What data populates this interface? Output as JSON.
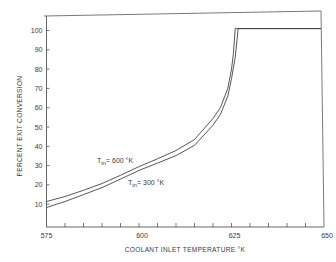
{
  "chart_data": {
    "type": "line",
    "title": "",
    "xlabel": "COOLANT INLET TEMPERATURE °K",
    "ylabel": "PERCENT EXIT CONVERSION",
    "xlim": [
      575,
      650
    ],
    "ylim": [
      0,
      105
    ],
    "grid": false,
    "legend": "none (inline annotations)",
    "x_ticks": [
      575,
      600,
      625,
      650
    ],
    "x_minor_step": 5,
    "y_ticks": [
      10,
      20,
      30,
      40,
      50,
      60,
      70,
      80,
      90,
      100
    ],
    "series": [
      {
        "name": "T_in = 600 °K",
        "x": [
          575,
          580,
          585,
          590,
          595,
          600,
          605,
          610,
          615,
          620,
          622,
          624,
          625,
          625.5,
          626,
          650
        ],
        "y": [
          11.4,
          14,
          17.2,
          20.7,
          25,
          29.5,
          33.5,
          37.8,
          43.5,
          54.4,
          60,
          70,
          80,
          88,
          101,
          101
        ]
      },
      {
        "name": "T_in = 300 °K",
        "x": [
          575,
          580,
          585,
          590,
          595,
          600,
          605,
          610,
          615,
          620,
          622,
          624,
          625,
          626,
          626.8,
          650
        ],
        "y": [
          8.3,
          11.4,
          15,
          18.6,
          23,
          27.5,
          31.3,
          35.2,
          40.5,
          51,
          56.5,
          66,
          75,
          86,
          101,
          101
        ]
      }
    ],
    "annotations": [
      {
        "text": "T",
        "sub": "in",
        "rest": "= 600 °K",
        "x": 589,
        "y": 31
      },
      {
        "text": "T",
        "sub": "in",
        "rest": "= 300 °K",
        "x": 597.5,
        "y": 20
      }
    ]
  },
  "labels": {
    "ylabel": "PERCENT EXIT CONVERSION",
    "xlabel": "COOLANT INLET TEMPERATURE °K",
    "ann1_T": "T",
    "ann1_sub": "in",
    "ann1_rest": "= 600  °K",
    "ann2_T": "T",
    "ann2_sub": "in",
    "ann2_rest": "= 300  °K"
  }
}
